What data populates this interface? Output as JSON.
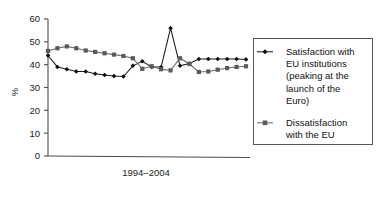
{
  "chart_data": {
    "type": "line",
    "title": "",
    "xlabel": "1994–2004",
    "ylabel": "%",
    "ylim": [
      0,
      60
    ],
    "yticks": [
      0,
      10,
      20,
      30,
      40,
      50,
      60
    ],
    "ytick_labels": [
      "0",
      "10",
      "20",
      "30",
      "40",
      "50",
      "60"
    ],
    "grid": false,
    "legend_position": "right",
    "x": [
      1,
      2,
      3,
      4,
      5,
      6,
      7,
      8,
      9,
      10,
      11,
      12,
      13,
      14,
      15,
      16,
      17,
      18,
      19,
      20,
      21,
      22
    ],
    "series": [
      {
        "name": "Satisfaction with EU institutions (peaking at the launch of the Euro)",
        "marker": "diamond",
        "color": "#101010",
        "values": [
          44.0,
          39.0,
          38.0,
          37.0,
          37.0,
          36.0,
          35.5,
          35.0,
          34.8,
          39.5,
          41.5,
          39.0,
          39.0,
          56.0,
          39.5,
          40.5,
          42.5,
          42.5,
          42.5,
          42.5,
          42.5,
          42.3
        ]
      },
      {
        "name": "Dissatisfaction with the EU",
        "marker": "square",
        "color": "#5a5a5a",
        "values": [
          46.0,
          47.2,
          48.0,
          47.2,
          46.2,
          45.6,
          45.0,
          44.4,
          43.8,
          42.8,
          38.2,
          39.3,
          38.0,
          37.5,
          42.8,
          40.3,
          36.8,
          37.0,
          37.8,
          38.5,
          39.0,
          39.3
        ]
      }
    ]
  },
  "legend": {
    "entries": [
      {
        "lines": [
          "Satisfaction with",
          "EU institutions",
          "(peaking at the",
          "launch of the",
          "Euro)"
        ],
        "marker": "diamond-marker"
      },
      {
        "lines": [
          "Dissatisfaction",
          "with the EU"
        ],
        "marker": "square-marker"
      }
    ]
  }
}
